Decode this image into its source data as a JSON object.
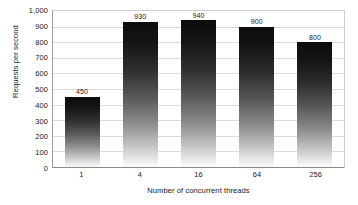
{
  "chart_data": {
    "type": "bar",
    "title": "",
    "categories": [
      "1",
      "4",
      "16",
      "64",
      "256"
    ],
    "values": [
      450,
      930,
      940,
      900,
      800
    ],
    "data_labels": [
      "450",
      "930",
      "940",
      "900",
      "800"
    ],
    "xlabel": "Number of concurrent threads",
    "ylabel": "Requests per second",
    "ylim": [
      0,
      1000
    ],
    "ytick_values": [
      0,
      100,
      200,
      300,
      400,
      500,
      600,
      700,
      800,
      900,
      1000
    ],
    "ytick_labels": [
      "0",
      "100",
      "200",
      "300",
      "400",
      "500",
      "600",
      "700",
      "800",
      "900",
      "1,000"
    ],
    "grid": true,
    "grid_axis": "y",
    "legend": false,
    "legend_position": "none",
    "series": [
      {
        "name": "Requests per second",
        "values": [
          450,
          930,
          940,
          900,
          800
        ]
      }
    ],
    "colors": {
      "bar_gradient_top": "#0c0c0c",
      "bar_gradient_bottom": "#fbfbfb",
      "gridline": "#dcdcdc",
      "axis": "#8a8a8a",
      "text": "#1a1a1a",
      "background": "#ffffff"
    }
  }
}
